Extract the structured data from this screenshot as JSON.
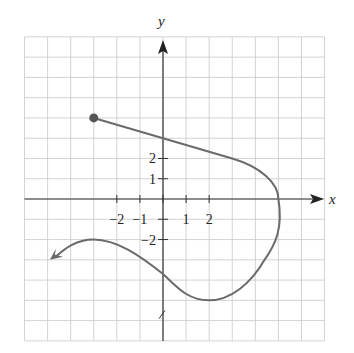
{
  "chart_data": {
    "type": "line",
    "title": "",
    "xlabel": "x",
    "ylabel": "y",
    "xlim": [
      -6,
      7
    ],
    "ylim": [
      -7,
      8
    ],
    "grid": true,
    "x_tick_labels": [
      "-2",
      "-1",
      "1",
      "2"
    ],
    "y_tick_labels": [
      "2",
      "1",
      "-2"
    ],
    "start_point": {
      "x": -3,
      "y": 4,
      "marker": "closed-dot"
    },
    "end_arrow": {
      "x": -4.9,
      "y": -3,
      "direction": "left-down"
    },
    "key_points": [
      {
        "x": -3,
        "y": 4,
        "note": "closed endpoint"
      },
      {
        "x": 0,
        "y": 3,
        "note": "y-intercept"
      },
      {
        "x": 3,
        "y": 2
      },
      {
        "x": 5,
        "y": 0,
        "note": "x-intercept"
      },
      {
        "x": 5,
        "y": -1,
        "note": "rightmost point"
      },
      {
        "x": 2,
        "y": -5,
        "note": "local minimum"
      },
      {
        "x": 0,
        "y": -3.7,
        "note": "y-intercept"
      },
      {
        "x": -3,
        "y": -2,
        "note": "local maximum"
      }
    ],
    "series": [
      {
        "name": "curve",
        "x": [
          -3,
          0,
          3,
          3.8,
          4.5,
          5,
          5.1,
          5,
          4.4,
          3.8,
          2.8,
          2,
          1,
          0,
          -1,
          -2,
          -3,
          -4,
          -4.9
        ],
        "y": [
          4,
          3,
          2,
          1.7,
          1,
          0,
          -1,
          -2,
          -3,
          -4,
          -4.8,
          -5,
          -4.6,
          -3.7,
          -2.9,
          -2.2,
          -2,
          -2.3,
          -3
        ]
      }
    ]
  },
  "labels": {
    "x_axis": "x",
    "y_axis": "y",
    "x_ticks": [
      {
        "value": -2,
        "text": "−2"
      },
      {
        "value": -1,
        "text": "−1"
      },
      {
        "value": 1,
        "text": "1"
      },
      {
        "value": 2,
        "text": "2"
      }
    ],
    "y_ticks": [
      {
        "value": 2,
        "text": "2"
      },
      {
        "value": 1,
        "text": "1"
      },
      {
        "value": -2,
        "text": "−2"
      }
    ]
  },
  "colors": {
    "curve": "#6a6a6a",
    "grid": "#c8c8c8",
    "axis": "#333333"
  }
}
